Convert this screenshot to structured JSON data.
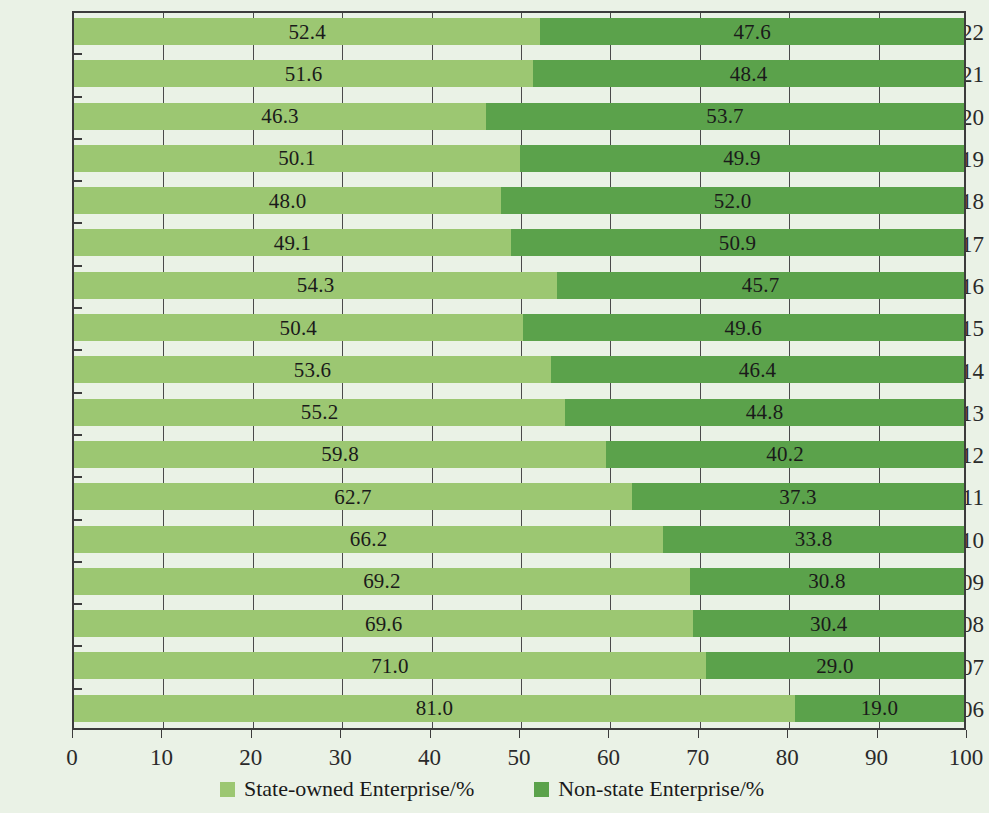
{
  "chart_data": {
    "type": "bar",
    "subtype": "horizontal-stacked-100-percent",
    "title": "",
    "subtitle": "",
    "xlabel": "",
    "ylabel": "",
    "xlim": [
      0,
      100
    ],
    "xticks": [
      0,
      10,
      20,
      30,
      40,
      50,
      60,
      70,
      80,
      90,
      100
    ],
    "xtick_labels": [
      "0",
      "10",
      "20",
      "30",
      "40",
      "50",
      "60",
      "70",
      "80",
      "90",
      "100"
    ],
    "grid": true,
    "grid_axis": "x",
    "legend_position": "bottom",
    "categories": [
      "2022",
      "2021",
      "2020",
      "2019",
      "2018",
      "2017",
      "2016",
      "2015",
      "2014",
      "2013",
      "2012",
      "2011",
      "2010",
      "2009",
      "2008",
      "2007",
      "2006"
    ],
    "series": [
      {
        "name": "State-owned Enterprise/%",
        "color": "#9cc772",
        "values": [
          52.4,
          51.6,
          46.3,
          50.1,
          48.0,
          49.1,
          54.3,
          50.4,
          53.6,
          55.2,
          59.8,
          62.7,
          66.2,
          69.2,
          69.6,
          71.0,
          81.0
        ],
        "value_labels": [
          "52.4",
          "51.6",
          "46.3",
          "50.1",
          "48.0",
          "49.1",
          "54.3",
          "50.4",
          "53.6",
          "55.2",
          "59.8",
          "62.7",
          "66.2",
          "69.2",
          "69.6",
          "71.0",
          "81.0"
        ]
      },
      {
        "name": "Non-state Enterprise/%",
        "color": "#5ba24b",
        "values": [
          47.6,
          48.4,
          53.7,
          49.9,
          52.0,
          50.9,
          45.7,
          49.6,
          46.4,
          44.8,
          40.2,
          37.3,
          33.8,
          30.8,
          30.4,
          29.0,
          19.0
        ],
        "value_labels": [
          "47.6",
          "48.4",
          "53.7",
          "49.9",
          "52.0",
          "50.9",
          "45.7",
          "49.6",
          "46.4",
          "44.8",
          "40.2",
          "37.3",
          "33.8",
          "30.8",
          "30.4",
          "29.0",
          "19.0"
        ]
      }
    ]
  },
  "legend": {
    "items": [
      {
        "label": "State-owned Enterprise/%",
        "color": "#9cc772"
      },
      {
        "label": "Non-state Enterprise/%",
        "color": "#5ba24b"
      }
    ]
  },
  "colors": {
    "background": "#eaf2e6",
    "axis": "#3c3c3c",
    "text": "#1a1a1a",
    "series_a": "#9cc772",
    "series_b": "#5ba24b"
  }
}
